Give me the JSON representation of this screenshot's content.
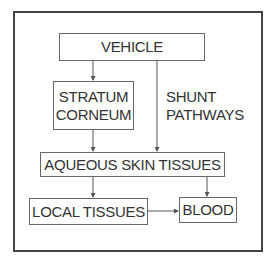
{
  "diagram": {
    "type": "flowchart",
    "nodes": {
      "vehicle": "VEHICLE",
      "stratum_line1": "STRATUM",
      "stratum_line2": "CORNEUM",
      "shunt_line1": "SHUNT",
      "shunt_line2": "PATHWAYS",
      "aqueous": "AQUEOUS SKIN TISSUES",
      "local": "LOCAL TISSUES",
      "blood": "BLOOD"
    },
    "edges": [
      {
        "from": "VEHICLE",
        "to": "STRATUM CORNEUM"
      },
      {
        "from": "VEHICLE",
        "to": "AQUEOUS SKIN TISSUES",
        "label": "SHUNT PATHWAYS"
      },
      {
        "from": "STRATUM CORNEUM",
        "to": "AQUEOUS SKIN TISSUES"
      },
      {
        "from": "AQUEOUS SKIN TISSUES",
        "to": "LOCAL TISSUES"
      },
      {
        "from": "AQUEOUS SKIN TISSUES",
        "to": "BLOOD"
      },
      {
        "from": "LOCAL TISSUES",
        "to": "BLOOD"
      }
    ],
    "colors": {
      "line": "#555555",
      "text": "#333333",
      "frame": "#444444"
    }
  }
}
